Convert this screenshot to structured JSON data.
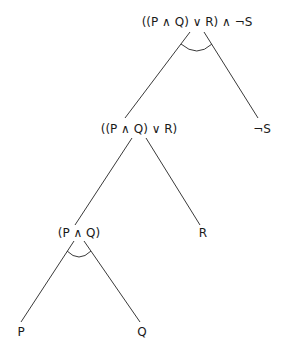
{
  "diagram": {
    "type": "and-or-tree",
    "nodes": [
      {
        "id": "root",
        "label": "((P ∧ Q) ∨ R) ∧ ¬S",
        "connective": "and"
      },
      {
        "id": "or",
        "label": "((P ∧ Q) ∨ R)",
        "connective": "or"
      },
      {
        "id": "notS",
        "label": "¬S",
        "connective": "leaf"
      },
      {
        "id": "and",
        "label": "(P ∧ Q)",
        "connective": "and"
      },
      {
        "id": "R",
        "label": "R",
        "connective": "leaf"
      },
      {
        "id": "P",
        "label": "P",
        "connective": "leaf"
      },
      {
        "id": "Q",
        "label": "Q",
        "connective": "leaf"
      }
    ],
    "edges": [
      {
        "from": "root",
        "to": "or"
      },
      {
        "from": "root",
        "to": "notS"
      },
      {
        "from": "or",
        "to": "and"
      },
      {
        "from": "or",
        "to": "R"
      },
      {
        "from": "and",
        "to": "P"
      },
      {
        "from": "and",
        "to": "Q"
      }
    ]
  }
}
